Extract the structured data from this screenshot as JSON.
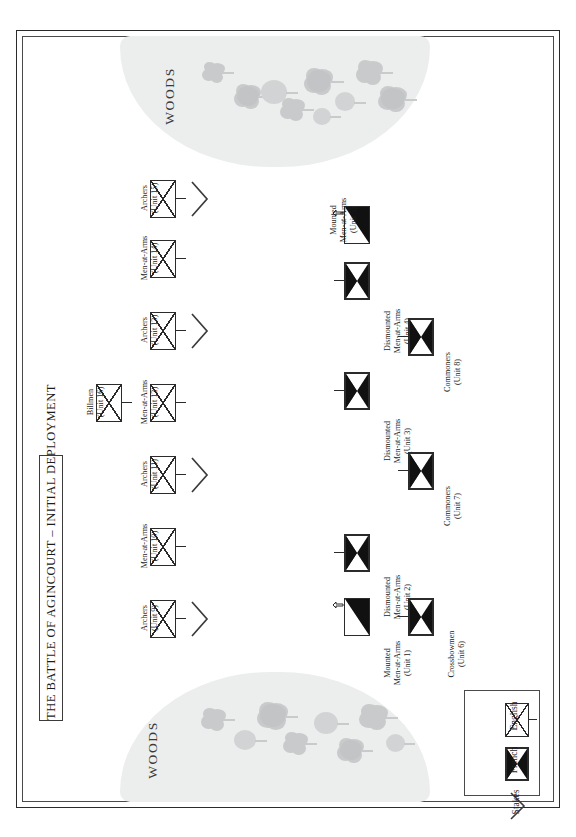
{
  "title": {
    "text": "THE BATTLE OF AGINCOURT – INITIAL DEPLOYMENT"
  },
  "terrain": {
    "woods_top_label": "WOODS",
    "woods_bottom_label": "WOODS",
    "woods_color": "#eceded",
    "tree_color": "#c9cacb"
  },
  "legend": {
    "items": [
      {
        "label": "English",
        "symbol": "english-unit-symbol"
      },
      {
        "label": "French",
        "symbol": "french-unit-symbol"
      },
      {
        "label": "Stakes",
        "symbol": "stakes-chevron-symbol"
      }
    ]
  },
  "colors": {
    "ink": "#2b2b2b",
    "fill_black": "#111111",
    "paper": "#ffffff"
  },
  "armies": {
    "english": {
      "name": "English",
      "units": [
        {
          "id": 9,
          "type": "Archers",
          "name_line1": "Archers",
          "name_line2": "(Unit 9)",
          "stakes": true
        },
        {
          "id": 10,
          "type": "Men-at-Arms",
          "name_line1": "Men-at-Arms",
          "name_line2": "(Unit 10)",
          "stakes": false
        },
        {
          "id": 11,
          "type": "Archers",
          "name_line1": "Archers",
          "name_line2": "(Unit 11)",
          "stakes": true
        },
        {
          "id": 12,
          "type": "Men-at-Arms",
          "name_line1": "Men-at-Arms",
          "name_line2": "(Unit 12)",
          "stakes": false
        },
        {
          "id": 16,
          "type": "Billmen",
          "name_line1": "Billmen",
          "name_line2": "(Unit 16)",
          "stakes": false
        },
        {
          "id": 13,
          "type": "Archers",
          "name_line1": "Archers",
          "name_line2": "(Unit 13)",
          "stakes": true
        },
        {
          "id": 14,
          "type": "Men-at-Arms",
          "name_line1": "Men-at-Arms",
          "name_line2": "(Unit 14)",
          "stakes": false
        },
        {
          "id": 15,
          "type": "Archers",
          "name_line1": "Archers",
          "name_line2": "(Unit 15)",
          "stakes": true
        }
      ]
    },
    "french": {
      "name": "French",
      "units": [
        {
          "id": 1,
          "type": "Mounted Men-at-Arms",
          "name_line1": "Mounted",
          "name_line2": "Men-at-Arms",
          "name_line3": "(Unit 1)",
          "mounted": true
        },
        {
          "id": 2,
          "type": "Dismounted Men-at-Arms",
          "name_line1": "Dismounted",
          "name_line2": "Men-at-Arms",
          "name_line3": "(Unit 2)",
          "mounted": false
        },
        {
          "id": 3,
          "type": "Dismounted Men-at-Arms",
          "name_line1": "Dismounted",
          "name_line2": "Men-at-Arms",
          "name_line3": "(Unit 3)",
          "mounted": false
        },
        {
          "id": 4,
          "type": "Dismounted Men-at-Arms",
          "name_line1": "Dismounted",
          "name_line2": "Men-at-Arms",
          "name_line3": "(Unit 4)",
          "mounted": false
        },
        {
          "id": 5,
          "type": "Mounted Men-at-Arms",
          "name_line1": "Mounted",
          "name_line2": "Men-at-Arms",
          "name_line3": "(Unit 5)",
          "mounted": true
        },
        {
          "id": 6,
          "type": "Crossbowmen",
          "name_line1": "Crossbowmen",
          "name_line2": "(Unit 6)",
          "mounted": false
        },
        {
          "id": 7,
          "type": "Commoners",
          "name_line1": "Commoners",
          "name_line2": "(Unit 7)",
          "mounted": false
        },
        {
          "id": 8,
          "type": "Commoners",
          "name_line1": "Commoners",
          "name_line2": "(Unit 8)",
          "mounted": false
        }
      ]
    }
  }
}
